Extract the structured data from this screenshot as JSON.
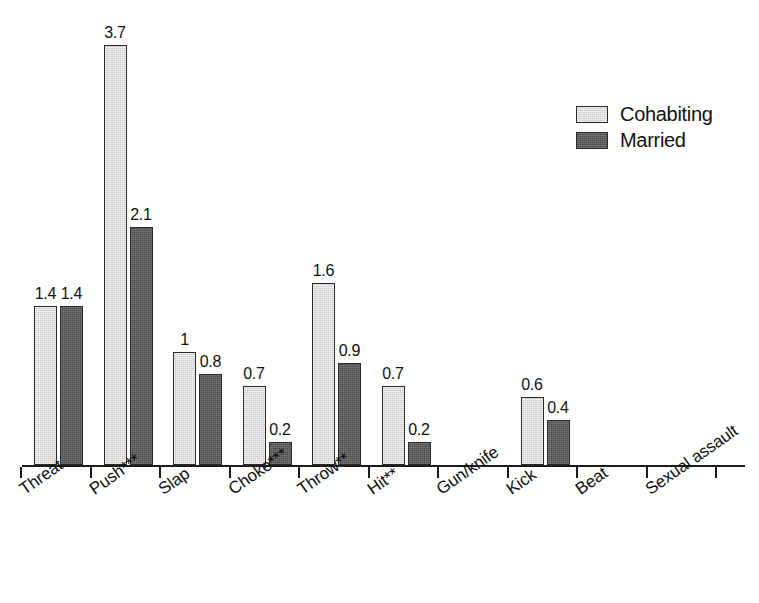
{
  "chart_data": {
    "type": "bar",
    "title": "",
    "subtitle": "",
    "xlabel": "",
    "ylabel": "",
    "grid": false,
    "ylim": [
      0,
      3.9
    ],
    "legend_position": "top-right",
    "categories": [
      "Threat",
      "Push***",
      "Slap",
      "Choke***",
      "Throw**",
      "Hit**",
      "Gun/knife",
      "Kick",
      "Beat",
      "Sexual assault"
    ],
    "series": [
      {
        "name": "Cohabiting",
        "color": "#cdcdcd",
        "values": [
          1.4,
          3.7,
          1,
          0.7,
          1.6,
          0.7,
          0,
          0.6,
          0,
          0
        ],
        "labels": [
          "1.4",
          "3.7",
          "1",
          "0.7",
          "1.6",
          "0.7",
          "",
          "0.6",
          "",
          ""
        ]
      },
      {
        "name": "Married",
        "color": "#4c4c4c",
        "values": [
          1.4,
          2.1,
          0.8,
          0.2,
          0.9,
          0.2,
          0,
          0.4,
          0,
          0
        ],
        "labels": [
          "1.4",
          "2.1",
          "0.8",
          "0.2",
          "0.9",
          "0.2",
          "",
          "0.4",
          "",
          ""
        ]
      }
    ]
  },
  "legend": {
    "items": [
      {
        "label": "Cohabiting",
        "key": "cohabiting"
      },
      {
        "label": "Married",
        "key": "married"
      }
    ]
  }
}
